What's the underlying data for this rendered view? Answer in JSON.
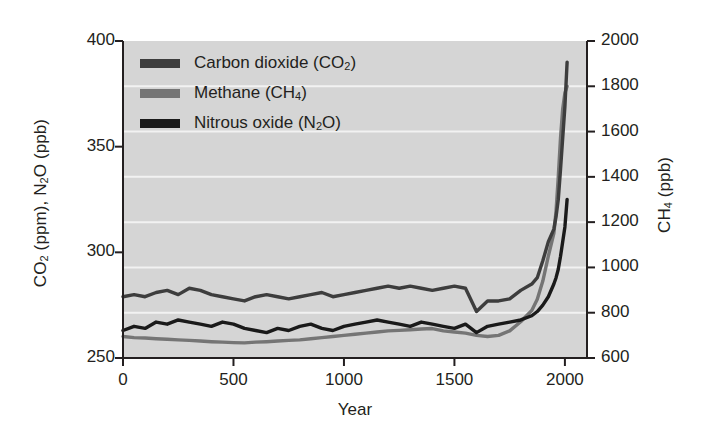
{
  "chart_data": {
    "type": "line",
    "title": "",
    "xlabel": "Year",
    "ylabel_left": "CO2 (ppm), N2O (ppb)",
    "ylabel_right": "CH4 (ppb)",
    "xlim": [
      0,
      2100
    ],
    "ylim_left": [
      250,
      400
    ],
    "ylim_right": [
      600,
      2000
    ],
    "xticks": [
      0,
      500,
      1000,
      1500,
      2000
    ],
    "xtick_labels": [
      "0",
      "500",
      "1000",
      "1500",
      "2000"
    ],
    "yticks_left": [
      250,
      300,
      350,
      400
    ],
    "ytick_labels_left": [
      "250",
      "300",
      "350",
      "400"
    ],
    "yticks_right": [
      600,
      800,
      1000,
      1200,
      1400,
      1600,
      1800,
      2000
    ],
    "ytick_labels_right": [
      "600",
      "800",
      "1000",
      "1200",
      "1400",
      "1600",
      "1800",
      "2000"
    ],
    "grid": "horizontal-white",
    "plot_background": "#d5d5d5",
    "legend_position": "top-left-inside",
    "series": [
      {
        "name": "Carbon dioxide (CO2)",
        "legend_label": "Carbon dioxide (CO",
        "legend_sub": "2",
        "legend_tail": ")",
        "color": "#3d3d3d",
        "axis": "left",
        "units": "ppm",
        "x": [
          0,
          50,
          100,
          150,
          200,
          250,
          300,
          350,
          400,
          450,
          500,
          550,
          600,
          650,
          700,
          750,
          800,
          850,
          900,
          950,
          1000,
          1050,
          1100,
          1150,
          1200,
          1250,
          1300,
          1350,
          1400,
          1450,
          1500,
          1550,
          1600,
          1650,
          1700,
          1750,
          1800,
          1850,
          1875,
          1900,
          1925,
          1950,
          1960,
          1970,
          1980,
          1990,
          2000,
          2010
        ],
        "y": [
          279,
          280,
          279,
          281,
          282,
          280,
          283,
          282,
          280,
          279,
          278,
          277,
          279,
          280,
          279,
          278,
          279,
          280,
          281,
          279,
          280,
          281,
          282,
          283,
          284,
          283,
          284,
          283,
          282,
          283,
          284,
          283,
          272,
          277,
          277,
          278,
          282,
          285,
          288,
          296,
          305,
          311,
          317,
          325,
          339,
          354,
          369,
          390
        ]
      },
      {
        "name": "Methane (CH4)",
        "legend_label": "Methane (CH",
        "legend_sub": "4",
        "legend_tail": ")",
        "color": "#757575",
        "axis": "right",
        "units": "ppb",
        "x": [
          0,
          50,
          100,
          150,
          200,
          250,
          300,
          350,
          400,
          450,
          500,
          550,
          600,
          650,
          700,
          750,
          800,
          850,
          900,
          950,
          1000,
          1050,
          1100,
          1150,
          1200,
          1250,
          1300,
          1350,
          1400,
          1450,
          1500,
          1550,
          1600,
          1650,
          1700,
          1750,
          1800,
          1850,
          1875,
          1900,
          1925,
          1950,
          1960,
          1970,
          1980,
          1990,
          2000,
          2010
        ],
        "y": [
          695,
          690,
          688,
          685,
          683,
          680,
          678,
          675,
          672,
          670,
          668,
          667,
          670,
          672,
          675,
          678,
          680,
          685,
          690,
          695,
          700,
          705,
          710,
          715,
          720,
          722,
          725,
          728,
          730,
          720,
          715,
          710,
          700,
          695,
          700,
          720,
          760,
          810,
          860,
          940,
          1050,
          1150,
          1250,
          1400,
          1570,
          1700,
          1770,
          1800
        ]
      },
      {
        "name": "Nitrous oxide (N2O)",
        "legend_label": "Nitrous oxide (N",
        "legend_sub": "2",
        "legend_tail": "O)",
        "color": "#1a1a1a",
        "axis": "left",
        "units": "ppb",
        "y_note": "plotted against left axis scale",
        "x": [
          0,
          50,
          100,
          150,
          200,
          250,
          300,
          350,
          400,
          450,
          500,
          550,
          600,
          650,
          700,
          750,
          800,
          850,
          900,
          950,
          1000,
          1050,
          1100,
          1150,
          1200,
          1250,
          1300,
          1350,
          1400,
          1450,
          1500,
          1550,
          1600,
          1650,
          1700,
          1750,
          1800,
          1850,
          1875,
          1900,
          1925,
          1950,
          1960,
          1970,
          1980,
          1990,
          2000,
          2010
        ],
        "y": [
          263,
          265,
          264,
          267,
          266,
          268,
          267,
          266,
          265,
          267,
          266,
          264,
          263,
          262,
          264,
          263,
          265,
          266,
          264,
          263,
          265,
          266,
          267,
          268,
          267,
          266,
          265,
          267,
          266,
          265,
          264,
          266,
          262,
          265,
          266,
          267,
          268,
          270,
          272,
          275,
          279,
          285,
          288,
          292,
          298,
          305,
          312,
          325
        ]
      }
    ],
    "annotations": []
  },
  "axes": {
    "xlabel": "Year",
    "ylabel_left_parts": {
      "a": "CO",
      "sub1": "2",
      "b": " (ppm), N",
      "sub2": "2",
      "c": "O (ppb)"
    },
    "ylabel_right_parts": {
      "a": "CH",
      "sub": "4",
      "b": " (ppb)"
    }
  }
}
